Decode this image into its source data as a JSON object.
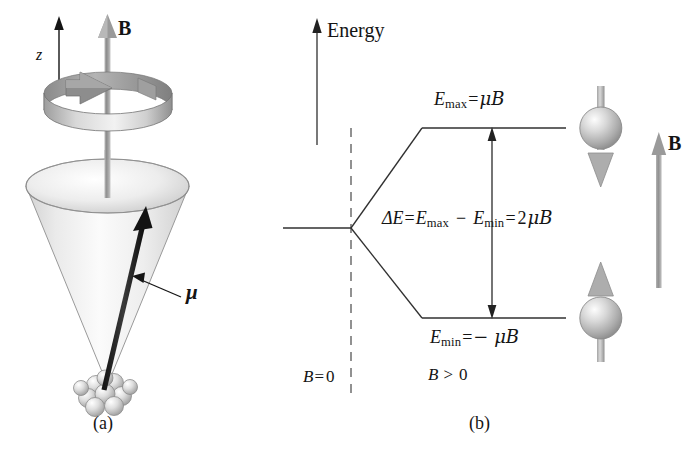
{
  "figure": {
    "width": 696,
    "height": 461,
    "background": "#ffffff",
    "ink_color": "#141414",
    "shade_color": "#9a9a9a"
  },
  "panel_a": {
    "caption": "(a)",
    "field_label": "B",
    "axis_label": "z",
    "moment_label": "μ",
    "description": "Magnetic moment vector precessing on a cone about the magnetic field direction z",
    "elements": {
      "precession_ring": "circular-arrow-ring",
      "cone": "precession-cone",
      "nucleus": "nucleus-sphere-cluster",
      "field_arrow": "field-arrow-up",
      "z_axis_arrow": "z-axis-arrow-up",
      "moment_arrow": "magnetic-moment-arrow",
      "leader_line": "moment-leader-line"
    }
  },
  "panel_b": {
    "caption": "(b)",
    "axis_label": "Energy",
    "upper_level": {
      "symbol": "E",
      "subscript": "max",
      "relation": "=",
      "value": "μB",
      "full": "E_max = μB",
      "spin": "down"
    },
    "lower_level": {
      "symbol": "E",
      "subscript": "min",
      "relation": "=",
      "value": "− μB",
      "full": "E_min = − μB",
      "spin": "up"
    },
    "splitting": {
      "delta": "ΔE",
      "eq1": "=",
      "term1_sym": "E",
      "term1_sub": "max",
      "minus": "−",
      "term2_sym": "E",
      "term2_sub": "min",
      "eq2": "=",
      "result_coeff": "2",
      "result_sym": "μB",
      "full": "ΔE = E_max − E_min = 2μB"
    },
    "region_left": "B = 0",
    "region_right": "B > 0",
    "region_left_parts": {
      "sym": "B",
      "rel": "=",
      "val": "0"
    },
    "region_right_parts": {
      "sym": "B",
      "rel": ">",
      "val": "0"
    },
    "field_label": "B",
    "elements": {
      "energy_axis_arrow": "energy-axis-arrow",
      "divider": "dashed-divider-line",
      "zero_field_level": "zero-field-level-line",
      "upper_branch": "upper-level-branch",
      "lower_branch": "lower-level-branch",
      "upper_level_line": "upper-level-line",
      "lower_level_line": "lower-level-line",
      "split_arrow": "double-headed-split-arrow",
      "upper_spin": "spin-down-sphere",
      "lower_spin": "spin-up-sphere",
      "field_arrow": "field-arrow-up"
    }
  }
}
